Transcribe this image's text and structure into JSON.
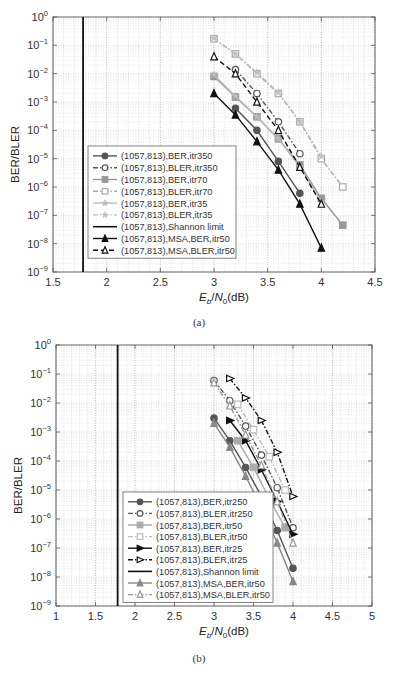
{
  "chart_data": [
    {
      "type": "line",
      "panel": "a",
      "caption": "(a)",
      "title": "",
      "xlabel": "E_b/N_0(dB)",
      "ylabel": "BER/BLER",
      "xlim": [
        1.5,
        4.5
      ],
      "xticks": [
        1.5,
        2,
        2.5,
        3,
        3.5,
        4,
        4.5
      ],
      "xtick_labels": [
        "1.5",
        "2",
        "2.5",
        "3",
        "3.5",
        "4",
        "4.5"
      ],
      "ylim": [
        1e-09,
        1
      ],
      "yscale": "log",
      "ytick_exponents": [
        0,
        -1,
        -2,
        -3,
        -4,
        -5,
        -6,
        -7,
        -8,
        -9
      ],
      "grid": true,
      "legend_position": "lower-left inside",
      "shannon_limit_x": 1.78,
      "series": [
        {
          "name": "(1057,813),BER,itr350",
          "color": "#555555",
          "dash": "solid",
          "marker": "circle-filled",
          "x": [
            3.2,
            3.4,
            3.6,
            3.8
          ],
          "y": [
            0.0006,
            0.0001,
            8e-06,
            6e-07
          ]
        },
        {
          "name": "(1057,813),BLER,itr350",
          "color": "#555555",
          "dash": "dashdot",
          "marker": "circle-open",
          "x": [
            3.2,
            3.4,
            3.6,
            3.8
          ],
          "y": [
            0.014,
            0.002,
            0.0002,
            1.5e-05
          ]
        },
        {
          "name": "(1057,813),BER,itr70",
          "color": "#999999",
          "dash": "solid",
          "marker": "square-filled",
          "x": [
            3.0,
            3.2,
            3.4,
            3.6,
            3.8,
            4.0,
            4.2
          ],
          "y": [
            0.008,
            0.0015,
            0.0003,
            5e-05,
            6e-06,
            4e-07,
            4.5e-08
          ]
        },
        {
          "name": "(1057,813),BLER,itr70",
          "color": "#aaaaaa",
          "dash": "dashdot",
          "marker": "square-open",
          "x": [
            3.0,
            3.2,
            3.4,
            3.6,
            3.8,
            4.0,
            4.2
          ],
          "y": [
            0.17,
            0.05,
            0.01,
            0.002,
            0.0002,
            1e-05,
            1e-06
          ]
        },
        {
          "name": "(1057,813),BER,itr35",
          "color": "#bbbbbb",
          "dash": "solid",
          "marker": "star",
          "x": [
            3.0,
            3.2,
            3.4,
            3.6,
            3.8,
            4.0
          ],
          "y": [
            0.009,
            0.0016,
            0.0003,
            5e-05,
            5e-06,
            3e-07
          ]
        },
        {
          "name": "(1057,813),BLER,itr35",
          "color": "#c0c0c0",
          "dash": "dashdot",
          "marker": "star",
          "x": [
            3.0,
            3.2,
            3.4,
            3.6,
            3.8,
            4.0
          ],
          "y": [
            0.18,
            0.05,
            0.011,
            0.0022,
            0.0002,
            1.2e-05
          ]
        },
        {
          "name": "(1057,813),Shannon limit",
          "color": "#111111",
          "dash": "solid",
          "marker": "none",
          "vertical": true
        },
        {
          "name": "(1057,813),MSA,BER,itr50",
          "color": "#111111",
          "dash": "solid",
          "marker": "triangle-filled",
          "x": [
            3.0,
            3.2,
            3.4,
            3.6,
            3.8,
            4.0
          ],
          "y": [
            0.002,
            0.00035,
            4e-05,
            4e-06,
            2.5e-07,
            7e-09
          ]
        },
        {
          "name": "(1057,813),MSA,BLER,itr50",
          "color": "#111111",
          "dash": "dashed",
          "marker": "triangle-open",
          "x": [
            3.0,
            3.2,
            3.4,
            3.6,
            3.8,
            4.0
          ],
          "y": [
            0.04,
            0.01,
            0.001,
            0.0001,
            5e-06,
            2.5e-07
          ]
        }
      ]
    },
    {
      "type": "line",
      "panel": "b",
      "caption": "(b)",
      "title": "",
      "xlabel": "E_b/N_0(dB)",
      "ylabel": "BER/BLER",
      "xlim": [
        1,
        5
      ],
      "xticks": [
        1,
        1.5,
        2,
        2.5,
        3,
        3.5,
        4,
        4.5,
        5
      ],
      "xtick_labels": [
        "1",
        "1.5",
        "2",
        "2.5",
        "3",
        "3.5",
        "4",
        "4.5",
        "5"
      ],
      "ylim": [
        1e-09,
        1
      ],
      "yscale": "log",
      "ytick_exponents": [
        0,
        -1,
        -2,
        -3,
        -4,
        -5,
        -6,
        -7,
        -8,
        -9
      ],
      "grid": true,
      "legend_position": "lower-center inside",
      "shannon_limit_x": 1.78,
      "series": [
        {
          "name": "(1057,813),BER,itr250",
          "color": "#555555",
          "dash": "solid",
          "marker": "circle-filled",
          "x": [
            3.0,
            3.2,
            3.4,
            3.6,
            3.8,
            4.0
          ],
          "y": [
            0.003,
            0.0005,
            6e-05,
            6e-06,
            4e-07,
            2e-08
          ]
        },
        {
          "name": "(1057,813),BLER,itr250",
          "color": "#555555",
          "dash": "dashdot",
          "marker": "circle-open",
          "x": [
            3.0,
            3.2,
            3.4,
            3.6,
            3.8,
            4.0
          ],
          "y": [
            0.06,
            0.012,
            0.0016,
            0.00016,
            1.2e-05,
            5e-07
          ]
        },
        {
          "name": "(1057,813),BER,itr50",
          "color": "#aaaaaa",
          "dash": "solid",
          "marker": "square-filled",
          "x": [
            3.3,
            3.5,
            3.7,
            3.9
          ],
          "y": [
            0.0005,
            6e-05,
            5e-06,
            5e-07
          ]
        },
        {
          "name": "(1057,813),BLER,itr50",
          "color": "#bbbbbb",
          "dash": "dashdot",
          "marker": "square-open",
          "x": [
            3.3,
            3.5,
            3.7,
            3.9
          ],
          "y": [
            0.009,
            0.0012,
            0.00014,
            1e-05
          ]
        },
        {
          "name": "(1057,813),BER,itr25",
          "color": "#111111",
          "dash": "solid",
          "marker": "triangle-right-filled",
          "x": [
            3.2,
            3.4,
            3.6,
            3.8,
            4.0
          ],
          "y": [
            0.0025,
            0.0005,
            5e-05,
            4e-06,
            3e-07
          ]
        },
        {
          "name": "(1057,813),BLER,itr25",
          "color": "#111111",
          "dash": "dashdot",
          "marker": "triangle-right-open",
          "x": [
            3.2,
            3.4,
            3.6,
            3.8,
            4.0
          ],
          "y": [
            0.07,
            0.015,
            0.0025,
            0.0002,
            6e-06
          ]
        },
        {
          "name": "(1057,813),Shannon limit",
          "color": "#111111",
          "dash": "solid",
          "marker": "none",
          "vertical": true
        },
        {
          "name": "(1057,813),MSA,BER,itr50",
          "color": "#888888",
          "dash": "solid",
          "marker": "triangle-filled",
          "x": [
            3.0,
            3.2,
            3.4,
            3.6,
            3.8,
            4.0
          ],
          "y": [
            0.002,
            0.0003,
            3e-05,
            2.5e-06,
            1.5e-07,
            7e-09
          ]
        },
        {
          "name": "(1057,813),MSA,BLER,itr50",
          "color": "#999999",
          "dash": "dashdot",
          "marker": "triangle-open",
          "x": [
            3.0,
            3.2,
            3.4,
            3.6,
            3.8,
            4.0
          ],
          "y": [
            0.05,
            0.008,
            0.0008,
            7e-05,
            4e-06,
            1.5e-07
          ]
        }
      ]
    }
  ]
}
